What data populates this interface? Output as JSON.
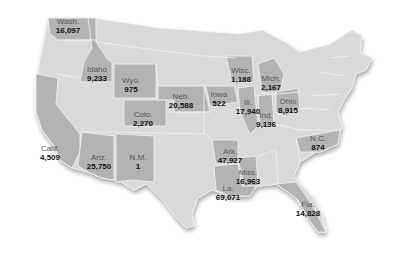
{
  "colors": {
    "base_state": "#d9d9d9",
    "highlight_state": "#b3b3b3",
    "border": "#f2f2f2",
    "label_name": "#555555",
    "label_value": "#111111"
  },
  "states": [
    {
      "name": "Wash.",
      "value": "16,097",
      "x": 68,
      "y": 22
    },
    {
      "name": "Idaho",
      "value": "9,233",
      "x": 97,
      "y": 70
    },
    {
      "name": "Wyo.",
      "value": "975",
      "x": 130,
      "y": 80
    },
    {
      "name": "Neb.",
      "value": "20,588",
      "x": 181,
      "y": 95
    },
    {
      "name": "Colo.",
      "value": "2,270",
      "x": 143,
      "y": 113
    },
    {
      "name": "Calif.",
      "value": "4,509",
      "x": 50,
      "y": 147
    },
    {
      "name": "Ariz.",
      "value": "25,750",
      "x": 99,
      "y": 155
    },
    {
      "name": "N.M.",
      "value": "1",
      "x": 138,
      "y": 157
    },
    {
      "name": "Iowa",
      "value": "522",
      "x": 219,
      "y": 91
    },
    {
      "name": "Wisc.",
      "value": "1,188",
      "x": 241,
      "y": 68
    },
    {
      "name": "Ill.",
      "value": "17,940",
      "x": 246,
      "y": 98
    },
    {
      "name": "Mich.",
      "value": "2,167",
      "x": 271,
      "y": 76
    },
    {
      "name": "Ind.",
      "value": "9,136",
      "x": 266,
      "y": 113
    },
    {
      "name": "Ohio",
      "value": "8,915",
      "x": 290,
      "y": 97
    },
    {
      "name": "N.C.",
      "value": "874",
      "x": 318,
      "y": 137
    },
    {
      "name": "Ark.",
      "value": "47,927",
      "x": 229,
      "y": 150
    },
    {
      "name": "Miss.",
      "value": "16,963",
      "x": 248,
      "y": 171
    },
    {
      "name": "La.",
      "value": "69,071",
      "x": 226,
      "y": 187
    },
    {
      "name": "Fla.",
      "value": "14,828",
      "x": 308,
      "y": 203
    }
  ]
}
